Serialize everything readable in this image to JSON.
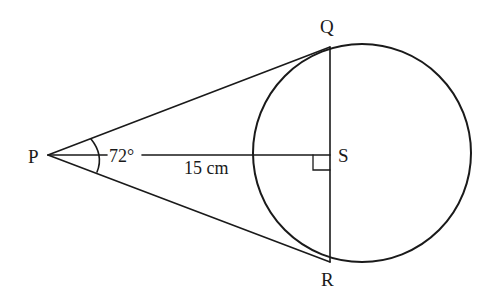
{
  "diagram": {
    "type": "geometry",
    "points": {
      "P": {
        "label": "P",
        "x": 48,
        "y": 155
      },
      "Q": {
        "label": "Q",
        "x": 330,
        "y": 47
      },
      "R": {
        "label": "R",
        "x": 330,
        "y": 262
      },
      "S": {
        "label": "S",
        "x": 330,
        "y": 155
      }
    },
    "circle": {
      "cx": 362,
      "cy": 153,
      "r": 109
    },
    "labels": {
      "angle": "72°",
      "length": "15 cm",
      "P": "P",
      "Q": "Q",
      "R": "R",
      "S": "S"
    },
    "colors": {
      "stroke": "#1a1a1a",
      "background": "#ffffff"
    }
  }
}
